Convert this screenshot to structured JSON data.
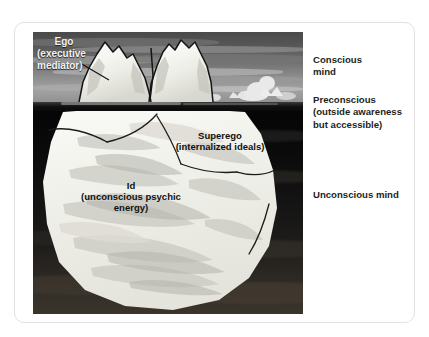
{
  "figure": {
    "alt_title": "Freud iceberg model of the mind",
    "labels": {
      "ego": "Ego\n(executive\nmediator)",
      "ego_line1": "Ego",
      "ego_line2": "(executive",
      "ego_line3": "mediator)",
      "superego_line1": "Superego",
      "superego_line2": "(internalized ideals)",
      "id_line1": "Id",
      "id_line2": "(unconscious psychic",
      "id_line3": "energy)"
    },
    "colors": {
      "sky": "#8c8c8c",
      "water": "#0a0a0a",
      "ice_light": "#f2f2ee",
      "ice_shadow": "#b9b9b4",
      "text_dark": "#231f20",
      "text_light": "#f2f2f2",
      "card_border": "#e2e2e2",
      "page_background": "#ffffff"
    }
  },
  "side_labels": {
    "conscious_line1": "Conscious",
    "conscious_line2": "mind",
    "preconscious_line1": "Preconscious",
    "preconscious_line2": "(outside awareness",
    "preconscious_line3": "but accessible)",
    "unconscious_line1": "Unconscious mind"
  }
}
